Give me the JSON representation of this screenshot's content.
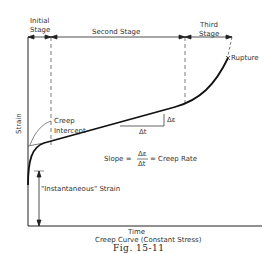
{
  "figure": {
    "caption": "Fig. 15-11",
    "subtitle": "Creep Curve (Constant Stress)"
  },
  "axes": {
    "xlabel": "Time",
    "ylabel": "Strain"
  },
  "stages": {
    "initial": [
      "Initial",
      "Stage"
    ],
    "second": "Second Stage",
    "third": [
      "Third",
      "Stage"
    ]
  },
  "annotations": {
    "rupture": "Rupture",
    "creep_intercept": [
      "Creep",
      "Intercept"
    ],
    "delta_epsilon": "Δε",
    "delta_t": "Δt",
    "slope_prefix": "Slope =",
    "slope_num": "Δε",
    "slope_den": "Δt",
    "slope_suffix": "= Creep Rate",
    "instantaneous_strain": "\"Instantaneous\" Strain"
  },
  "colors": {
    "ink": "#222222",
    "background": "#ffffff"
  }
}
